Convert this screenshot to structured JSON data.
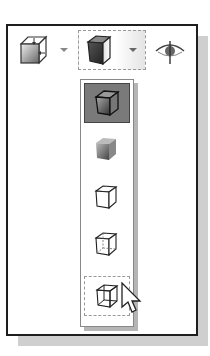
{
  "toolbar": {
    "buttons": [
      {
        "name": "view-orientation",
        "icon": "view-orientation-cube-icon",
        "has_dropdown": true
      },
      {
        "name": "display-style",
        "icon": "shaded-with-edges-cube-icon",
        "has_dropdown": true,
        "selected": true
      },
      {
        "name": "hide-show-items",
        "icon": "eye-icon",
        "has_dropdown": false
      }
    ]
  },
  "display_style_menu": {
    "items": [
      {
        "name": "shaded-with-edges",
        "icon": "shaded-with-edges-icon",
        "state": "active"
      },
      {
        "name": "shaded",
        "icon": "shaded-icon",
        "state": "normal"
      },
      {
        "name": "hidden-lines-removed",
        "icon": "hidden-lines-removed-icon",
        "state": "normal"
      },
      {
        "name": "hidden-lines-visible",
        "icon": "hidden-lines-visible-icon",
        "state": "normal"
      },
      {
        "name": "wireframe",
        "icon": "wireframe-icon",
        "state": "hover"
      }
    ]
  },
  "colors": {
    "frame": "#1e1e1e",
    "shadow": "#cfcfcf",
    "active": "#7a7a7a"
  }
}
